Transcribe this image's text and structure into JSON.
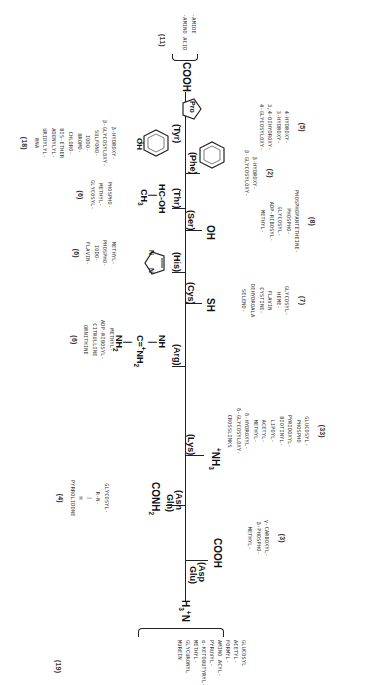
{
  "figure": {
    "n_terminus": {
      "label": "H3+N",
      "modifications": [
        "GLUCOSYL",
        "ACETYL-",
        "FORMYL-",
        "AMINO ACYL-",
        "PYRUVYL-",
        "α-KETOBUTYRYL-",
        "METHYL-",
        "GLYCURONYL",
        "MUREIN"
      ],
      "count": "(19)"
    },
    "c_terminus": {
      "label": "COOH",
      "modifications": [
        "-AMIDE",
        "-AMINO ACID"
      ],
      "count": "(11)"
    },
    "residues": [
      {
        "id": "asp_glu",
        "label_1": "(Asp",
        "label_2": "Glu)",
        "side_chain": "COOH",
        "count": "(3)",
        "modifications": [
          "γ-CARBOXYL-",
          "β-PHOSPHO-",
          "METHYL-"
        ]
      },
      {
        "id": "asn_gln",
        "label_1": "(Asn",
        "label_2": "Gln)",
        "side_chain": "CONH2",
        "count": "(4)",
        "modifications": [
          "GLYCOSYL-",
          "R-N-",
          "|",
          "H",
          "PYRROLIDONE"
        ]
      },
      {
        "id": "lys",
        "label": "(Lys)",
        "side_chain": "+NH3",
        "count": "(33)",
        "modifications": [
          "GLUCOSYL-",
          "PHOSPHO",
          "PYRIDOXYL-",
          "BIOTINYL-",
          "LIPOYL-",
          "ACETYL-",
          "METHYL-",
          "δ-HYDROXYL-",
          "δ-GLYCOSYLOXY-",
          "CROSSLINKS"
        ]
      },
      {
        "id": "arg",
        "label": "(Arg)",
        "side_chain_lines": [
          "NH",
          "|",
          "C=+NH2",
          "|",
          "NH2"
        ],
        "count": "(6)",
        "modifications": [
          "METHYL-",
          "ADP-RIBOSYL-",
          "CITRULLINE",
          "ORNITHINE"
        ]
      },
      {
        "id": "cys",
        "label": "(Cys)",
        "side_chain": "SH",
        "count": "(7)",
        "modifications": [
          "GLYCOSYL-",
          "HEME-",
          "FLAVIN",
          "CYSTINE-",
          "DEHYDROALA",
          "SELENO-"
        ]
      },
      {
        "id": "his",
        "label": "(His)",
        "side_chain": "imidazole",
        "count": "(6)",
        "modifications": [
          "METHYL-",
          "PHOSPHO-",
          "IODO-",
          "FLAVIN-"
        ]
      },
      {
        "id": "ser",
        "label": "(Ser)",
        "side_chain": "OH",
        "count": "(8)",
        "modifications": [
          "PHOSPHOPANTETHEINE-",
          "PHOSPHO-",
          "GLYCOSYL-",
          "ADP-RIBOSYL-",
          "METHYL-"
        ]
      },
      {
        "id": "thr",
        "label": "(Thr)",
        "side_chain_lines": [
          "HC-OH",
          "|",
          "CH3"
        ],
        "count": "(6)",
        "modifications": [
          "PHOSPHO-",
          "METHYL-",
          "GLYCOSYL-"
        ]
      },
      {
        "id": "phe",
        "label": "(Phe)",
        "side_chain": "phenyl",
        "count": "(2)",
        "modifications": [
          "β-HYDROXY-",
          "β-GLYCOSYLOXY-"
        ]
      },
      {
        "id": "tyr",
        "label": "(Tyr)",
        "side_chain": "OH",
        "count": "(18)",
        "modifications": [
          "β-HYDROXY-",
          "β-GLYCOSYLOXY-",
          "SULFONO-",
          "IODO-",
          "BROMO-",
          "CHLORO-",
          "BIS-ETHER",
          "ADENYLYL-",
          "URIDYLYL-",
          "RNA"
        ]
      },
      {
        "id": "pro",
        "label": "Pro",
        "count": "(5)",
        "modifications": [
          "4-HYDROXY-",
          "3-HYDROXY-",
          "3,4-DIHYDROXY-",
          "4-GLYCOSYLOXY-"
        ]
      }
    ]
  }
}
